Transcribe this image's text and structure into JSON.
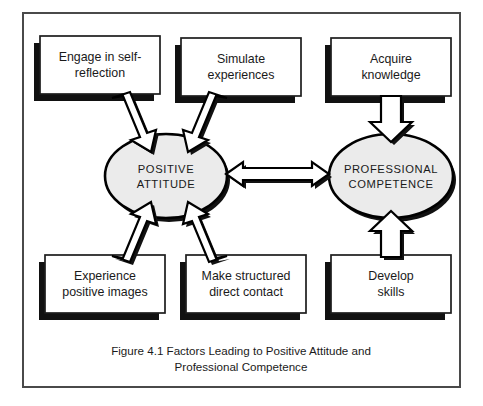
{
  "figure": {
    "caption_line1": "Figure 4.1  Factors Leading to Positive Attitude and",
    "caption_line2": "Professional Competence",
    "frame": {
      "border_color": "#4a4a4a",
      "background": "#ffffff"
    }
  },
  "nodes": {
    "positive_attitude": {
      "line1": "POSITIVE",
      "line2": "ATTITUDE",
      "fill": "#ebebeb",
      "stroke": "#000000"
    },
    "professional_competence": {
      "line1": "PROFESSIONAL",
      "line2": "COMPETENCE",
      "fill": "#ebebeb",
      "stroke": "#000000"
    }
  },
  "boxes": [
    {
      "id": "engage-in-self-reflection",
      "line1": "Engage in self-",
      "line2": "reflection",
      "position": "top-left"
    },
    {
      "id": "simulate-experiences",
      "line1": "Simulate",
      "line2": "experiences",
      "position": "top-center"
    },
    {
      "id": "acquire-knowledge",
      "line1": "Acquire",
      "line2": "knowledge",
      "position": "top-right"
    },
    {
      "id": "experience-positive-images",
      "line1": "Experience",
      "line2": "positive images",
      "position": "bottom-left"
    },
    {
      "id": "make-structured-direct-contact",
      "line1": "Make structured",
      "line2": "direct contact",
      "position": "bottom-center"
    },
    {
      "id": "develop-skills",
      "line1": "Develop",
      "line2": "skills",
      "position": "bottom-right"
    }
  ],
  "connectors": [
    {
      "id": "arrow-engage-to-attitude",
      "from": "engage-in-self-reflection",
      "to": "positive_attitude",
      "style": "block-arrow",
      "direction": "down-right"
    },
    {
      "id": "arrow-simulate-to-attitude",
      "from": "simulate-experiences",
      "to": "positive_attitude",
      "style": "block-arrow",
      "direction": "down-left"
    },
    {
      "id": "arrow-acquire-to-competence",
      "from": "acquire-knowledge",
      "to": "professional_competence",
      "style": "block-arrow",
      "direction": "down"
    },
    {
      "id": "arrow-images-to-attitude",
      "from": "experience-positive-images",
      "to": "positive_attitude",
      "style": "block-arrow",
      "direction": "up-right"
    },
    {
      "id": "arrow-contact-to-attitude",
      "from": "make-structured-direct-contact",
      "to": "positive_attitude",
      "style": "block-arrow",
      "direction": "up-left"
    },
    {
      "id": "arrow-skills-to-competence",
      "from": "develop-skills",
      "to": "professional_competence",
      "style": "block-arrow",
      "direction": "up"
    },
    {
      "id": "arrow-attitude-competence-bidirectional",
      "from": "positive_attitude",
      "to": "professional_competence",
      "style": "double-headed-arrow",
      "direction": "both"
    }
  ]
}
